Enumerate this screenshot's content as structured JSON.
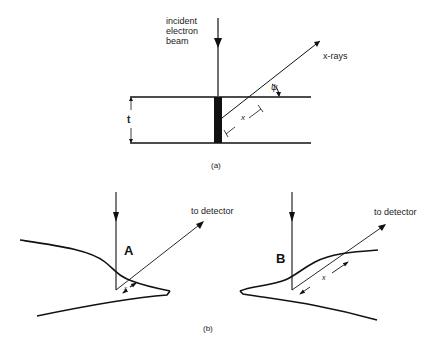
{
  "figure": {
    "panel_a": {
      "caption": "(a)",
      "beam_label_lines": [
        "incident",
        "electron",
        "beam"
      ],
      "xray_label": "x-rays",
      "thickness_label": "t",
      "path_label": "x",
      "angle_label": "ψ"
    },
    "panel_b": {
      "caption": "(b)",
      "case_a": {
        "label": "A",
        "detector_label": "to detector",
        "path_label": "x"
      },
      "case_b": {
        "label": "B",
        "detector_label": "to detector",
        "path_label": "x"
      }
    }
  }
}
